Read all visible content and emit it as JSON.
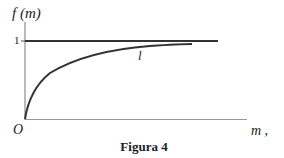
{
  "figure": {
    "y_axis_label": "f (m)",
    "x_axis_label": "m ,",
    "origin_label": "O",
    "tick_label_one": "1",
    "curve_label": "l",
    "caption": "Figura  4"
  },
  "colors": {
    "line": "#333333",
    "axis": "#888888",
    "background": "#ffffff"
  }
}
